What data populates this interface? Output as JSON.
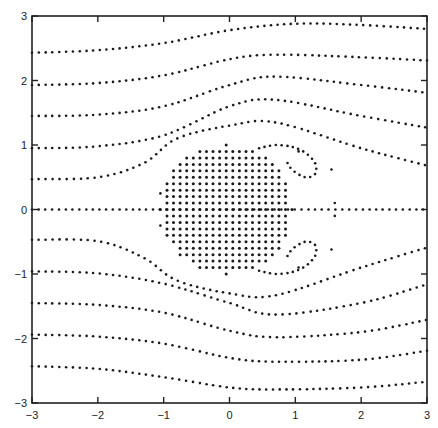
{
  "chart_data": {
    "type": "scatter",
    "title": "",
    "xlabel": "",
    "ylabel": "",
    "xlim": [
      -3,
      3
    ],
    "ylim": [
      -3,
      3
    ],
    "grid": false,
    "legend": null,
    "x_ticks": [
      "-3",
      "-2",
      "-1",
      "0",
      "1",
      "2",
      "3"
    ],
    "y_ticks": [
      "-3",
      "-2",
      "-1",
      "0",
      "1",
      "2",
      "3"
    ],
    "body": {
      "shape": "dot-filled disc",
      "center": [
        -0.05,
        0.0
      ],
      "radius": 1.0,
      "dot_spacing": 0.1
    },
    "series": [
      {
        "name": "streamline y0=2.5",
        "points": [
          [
            -3,
            2.43
          ],
          [
            -2,
            2.47
          ],
          [
            -1,
            2.58
          ],
          [
            0,
            2.78
          ],
          [
            1,
            2.88
          ],
          [
            2,
            2.86
          ],
          [
            3,
            2.8
          ]
        ]
      },
      {
        "name": "streamline y0=2.0",
        "points": [
          [
            -3,
            1.93
          ],
          [
            -2,
            1.96
          ],
          [
            -1,
            2.08
          ],
          [
            0,
            2.33
          ],
          [
            0.7,
            2.4
          ],
          [
            2,
            2.36
          ],
          [
            3,
            2.31
          ]
        ]
      },
      {
        "name": "streamline y0=1.5",
        "points": [
          [
            -3,
            1.45
          ],
          [
            -2,
            1.47
          ],
          [
            -1,
            1.6
          ],
          [
            0,
            1.93
          ],
          [
            0.7,
            2.06
          ],
          [
            2,
            1.93
          ],
          [
            3,
            1.81
          ]
        ]
      },
      {
        "name": "streamline y0=1.0",
        "points": [
          [
            -3,
            0.95
          ],
          [
            -2,
            0.98
          ],
          [
            -1,
            1.15
          ],
          [
            0,
            1.6
          ],
          [
            0.7,
            1.7
          ],
          [
            2,
            1.45
          ],
          [
            3,
            1.27
          ]
        ]
      },
      {
        "name": "streamline y0=0.5",
        "points": [
          [
            -3,
            0.47
          ],
          [
            -2,
            0.5
          ],
          [
            -1.3,
            0.72
          ],
          [
            -0.8,
            1.1
          ],
          [
            0,
            1.3
          ],
          [
            0.7,
            1.35
          ],
          [
            2,
            0.95
          ],
          [
            3,
            0.68
          ]
        ]
      },
      {
        "name": "streamline y0=0",
        "points": [
          [
            -3,
            0.0
          ],
          [
            -1.05,
            0.0
          ],
          [
            1.0,
            0.0
          ],
          [
            3,
            0.0
          ]
        ]
      },
      {
        "name": "streamline y0=-0.5",
        "points": [
          [
            -3,
            -0.47
          ],
          [
            -2,
            -0.49
          ],
          [
            -1.3,
            -0.75
          ],
          [
            -0.8,
            -1.1
          ],
          [
            0,
            -1.3
          ],
          [
            0.7,
            -1.33
          ],
          [
            2,
            -0.9
          ],
          [
            3,
            -0.59
          ]
        ]
      },
      {
        "name": "streamline y0=-1.0",
        "points": [
          [
            -3,
            -0.96
          ],
          [
            -2,
            -0.99
          ],
          [
            -1,
            -1.15
          ],
          [
            0,
            -1.45
          ],
          [
            0.7,
            -1.63
          ],
          [
            2,
            -1.45
          ],
          [
            3,
            -1.16
          ]
        ]
      },
      {
        "name": "streamline y0=-1.5",
        "points": [
          [
            -3,
            -1.45
          ],
          [
            -2,
            -1.48
          ],
          [
            -1,
            -1.6
          ],
          [
            0,
            -1.88
          ],
          [
            0.7,
            -1.98
          ],
          [
            2,
            -1.9
          ],
          [
            3,
            -1.71
          ]
        ]
      },
      {
        "name": "streamline y0=-2.0",
        "points": [
          [
            -3,
            -1.94
          ],
          [
            -2,
            -1.97
          ],
          [
            -1,
            -2.08
          ],
          [
            0,
            -2.3
          ],
          [
            0.7,
            -2.36
          ],
          [
            2,
            -2.33
          ],
          [
            3,
            -2.19
          ]
        ]
      },
      {
        "name": "streamline y0=-2.5",
        "points": [
          [
            -3,
            -2.43
          ],
          [
            -2,
            -2.47
          ],
          [
            -1,
            -2.6
          ],
          [
            0,
            -2.76
          ],
          [
            0.7,
            -2.79
          ],
          [
            2,
            -2.76
          ],
          [
            3,
            -2.67
          ]
        ]
      }
    ],
    "wake": {
      "upper_vortex": [
        [
          0.45,
          0.95
        ],
        [
          0.7,
          1.0
        ],
        [
          0.95,
          0.97
        ],
        [
          1.15,
          0.88
        ],
        [
          1.3,
          0.72
        ],
        [
          1.3,
          0.55
        ],
        [
          1.15,
          0.5
        ],
        [
          0.95,
          0.62
        ],
        [
          0.85,
          0.78
        ],
        [
          1.55,
          0.62
        ],
        [
          1.05,
          0.9
        ]
      ],
      "lower_vortex": [
        [
          0.45,
          -0.95
        ],
        [
          0.7,
          -1.0
        ],
        [
          0.95,
          -0.97
        ],
        [
          1.15,
          -0.88
        ],
        [
          1.3,
          -0.72
        ],
        [
          1.3,
          -0.55
        ],
        [
          1.15,
          -0.5
        ],
        [
          0.95,
          -0.62
        ],
        [
          0.85,
          -0.78
        ],
        [
          1.55,
          -0.62
        ],
        [
          1.05,
          -0.9
        ]
      ],
      "separation_marks": [
        [
          1.6,
          0.1
        ],
        [
          1.6,
          -0.1
        ],
        [
          -1.05,
          0.25
        ],
        [
          -1.05,
          -0.25
        ]
      ]
    },
    "plot_area_px": {
      "left": 32,
      "right": 427,
      "top": 16,
      "bottom": 403
    },
    "colors": {
      "dots": "#1a1a1a",
      "axes": "#222222",
      "background": "#ffffff"
    }
  }
}
